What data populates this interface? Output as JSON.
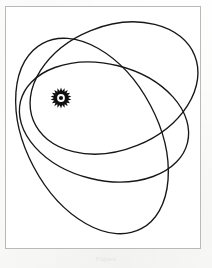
{
  "figure": {
    "caption": "Figure",
    "frame": {
      "x": 5,
      "y": 6,
      "width": 196,
      "height": 243,
      "border_color": "#b9b9b6",
      "background": "#ffffff"
    },
    "stroke_color": "#171717",
    "stroke_width": 1.35,
    "background_color": "#fdfdfc"
  },
  "sun": {
    "label": "sun-symbol",
    "center_x": 61,
    "center_y": 98,
    "ray_count": 18,
    "ray_outer_radius": 10.5,
    "ray_inner_radius": 7.2,
    "ring_radius": 5.4,
    "core_radius": 2.1,
    "color": "#111111"
  },
  "chart_data": {
    "type": "scatter",
    "xlabel": "",
    "ylabel": "",
    "grid": false,
    "legend": "none",
    "focus": {
      "x": 61,
      "y": 98
    },
    "orbits": [
      {
        "name": "orbit-1",
        "center_x": 114,
        "center_y": 88,
        "semi_major": 87,
        "semi_minor": 62,
        "rotation_deg": -22
      },
      {
        "name": "orbit-2",
        "center_x": 104,
        "center_y": 122,
        "semi_major": 86,
        "semi_minor": 58,
        "rotation_deg": 14
      },
      {
        "name": "orbit-3",
        "center_x": 92,
        "center_y": 136,
        "semi_major": 105,
        "semi_minor": 66,
        "rotation_deg": 62
      }
    ]
  }
}
